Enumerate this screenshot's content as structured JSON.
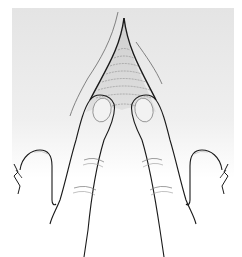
{
  "illustration": {
    "subject": "two fingers spreading skin fold",
    "colors": {
      "background_top": "#e6e6e6",
      "background_bottom": "#ffffff",
      "stroke": "#1a1a1a",
      "nail": "#cfcfcf",
      "fold_shade": "#d0d0d0",
      "hatch": "#8a8a8a"
    }
  }
}
